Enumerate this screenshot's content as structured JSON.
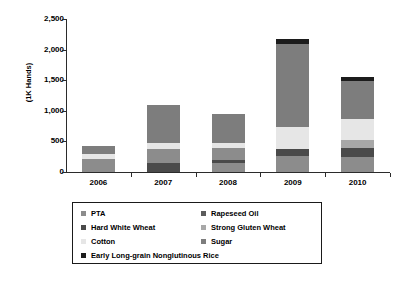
{
  "chart_data": {
    "type": "bar",
    "stacked": true,
    "title": "",
    "subtitle": "",
    "xlabel": "",
    "ylabel": "(1K Hands)",
    "categories": [
      "2006",
      "2007",
      "2008",
      "2009",
      "2010"
    ],
    "ytick_labels": [
      "0",
      "500",
      "1,000",
      "1,500",
      "2,000",
      "2,500"
    ],
    "ytick_values": [
      0,
      500,
      1000,
      1500,
      2000,
      2500
    ],
    "ylim": [
      0,
      2500
    ],
    "grid": false,
    "legend_position": "bottom",
    "series": [
      {
        "name": "PTA",
        "color": "#8c8c8c",
        "values": [
          210,
          225,
          205,
          255,
          250
        ]
      },
      {
        "name": "Rapeseed Oil",
        "color": "#5c5c5c",
        "values": [
          0,
          0,
          0,
          0,
          0
        ]
      },
      {
        "name": "Hard White Wheat",
        "color": "#4a4a4a",
        "values": [
          0,
          155,
          55,
          115,
          150
        ]
      },
      {
        "name": "Strong Gluten Wheat",
        "color": "#a8a8a8",
        "values": [
          0,
          0,
          0,
          0,
          120
        ]
      },
      {
        "name": "Cotton",
        "color": "#e6e6e6",
        "values": [
          80,
          95,
          75,
          370,
          340
        ]
      },
      {
        "name": "Sugar",
        "color": "#7d7d7d",
        "values": [
          140,
          625,
          475,
          1360,
          630
        ]
      },
      {
        "name": "Early Long-grain Nonglutinous Rice",
        "color": "#1c1c1c",
        "values": [
          0,
          0,
          0,
          80,
          70
        ]
      }
    ],
    "stack_order_bottom_to_top": [
      "PTA",
      "Hard White Wheat",
      "Strong Gluten Wheat",
      "Cotton",
      "Sugar",
      "Early Long-grain Nonglutinous Rice"
    ],
    "totals": [
      430,
      1100,
      810,
      2180,
      1560
    ],
    "bar_stacks": [
      {
        "category": "2006",
        "segments": [
          {
            "name": "PTA",
            "value": 210,
            "color": "#8c8c8c"
          },
          {
            "name": "Cotton",
            "value": 80,
            "color": "#e6e6e6"
          },
          {
            "name": "Sugar",
            "value": 140,
            "color": "#7d7d7d"
          }
        ]
      },
      {
        "category": "2007",
        "segments": [
          {
            "name": "Hard White Wheat",
            "value": 155,
            "color": "#4a4a4a"
          },
          {
            "name": "PTA",
            "value": 225,
            "color": "#8c8c8c"
          },
          {
            "name": "Cotton",
            "value": 95,
            "color": "#e6e6e6"
          },
          {
            "name": "Sugar",
            "value": 625,
            "color": "#7d7d7d"
          }
        ]
      },
      {
        "category": "2008",
        "segments": [
          {
            "name": "PTA",
            "value": 140,
            "color": "#8c8c8c"
          },
          {
            "name": "Hard White Wheat",
            "value": 55,
            "color": "#4a4a4a"
          },
          {
            "name": "PTA",
            "value": 205,
            "color": "#8c8c8c"
          },
          {
            "name": "Cotton",
            "value": 75,
            "color": "#e6e6e6"
          },
          {
            "name": "Sugar",
            "value": 475,
            "color": "#7d7d7d"
          }
        ]
      },
      {
        "category": "2009",
        "segments": [
          {
            "name": "PTA",
            "value": 255,
            "color": "#8c8c8c"
          },
          {
            "name": "Hard White Wheat",
            "value": 115,
            "color": "#4a4a4a"
          },
          {
            "name": "Cotton",
            "value": 370,
            "color": "#e6e6e6"
          },
          {
            "name": "Sugar",
            "value": 1360,
            "color": "#7d7d7d"
          },
          {
            "name": "Early Long-grain Nonglutinous Rice",
            "value": 80,
            "color": "#1c1c1c"
          }
        ]
      },
      {
        "category": "2010",
        "segments": [
          {
            "name": "PTA",
            "value": 250,
            "color": "#8c8c8c"
          },
          {
            "name": "Hard White Wheat",
            "value": 150,
            "color": "#4a4a4a"
          },
          {
            "name": "Strong Gluten Wheat",
            "value": 120,
            "color": "#a8a8a8"
          },
          {
            "name": "Cotton",
            "value": 340,
            "color": "#e6e6e6"
          },
          {
            "name": "Sugar",
            "value": 630,
            "color": "#7d7d7d"
          },
          {
            "name": "Early Long-grain Nonglutinous Rice",
            "value": 70,
            "color": "#1c1c1c"
          }
        ]
      }
    ]
  },
  "legend": {
    "entries": [
      {
        "label": "PTA",
        "color": "#8c8c8c",
        "col": 0,
        "row": 0
      },
      {
        "label": "Rapeseed Oil",
        "color": "#5c5c5c",
        "col": 1,
        "row": 0
      },
      {
        "label": "Hard White Wheat",
        "color": "#4a4a4a",
        "col": 0,
        "row": 1
      },
      {
        "label": "Strong Gluten Wheat",
        "color": "#a8a8a8",
        "col": 1,
        "row": 1
      },
      {
        "label": "Cotton",
        "color": "#e6e6e6",
        "col": 0,
        "row": 2
      },
      {
        "label": "Sugar",
        "color": "#7d7d7d",
        "col": 1,
        "row": 2
      },
      {
        "label": "Early Long-grain Nonglutinous Rice",
        "color": "#1c1c1c",
        "col": 0,
        "row": 3
      }
    ]
  },
  "colors": {
    "axis": "#2b2b2b",
    "text": "#000000",
    "background": "#ffffff",
    "legend_border": "#1a1a1a"
  }
}
